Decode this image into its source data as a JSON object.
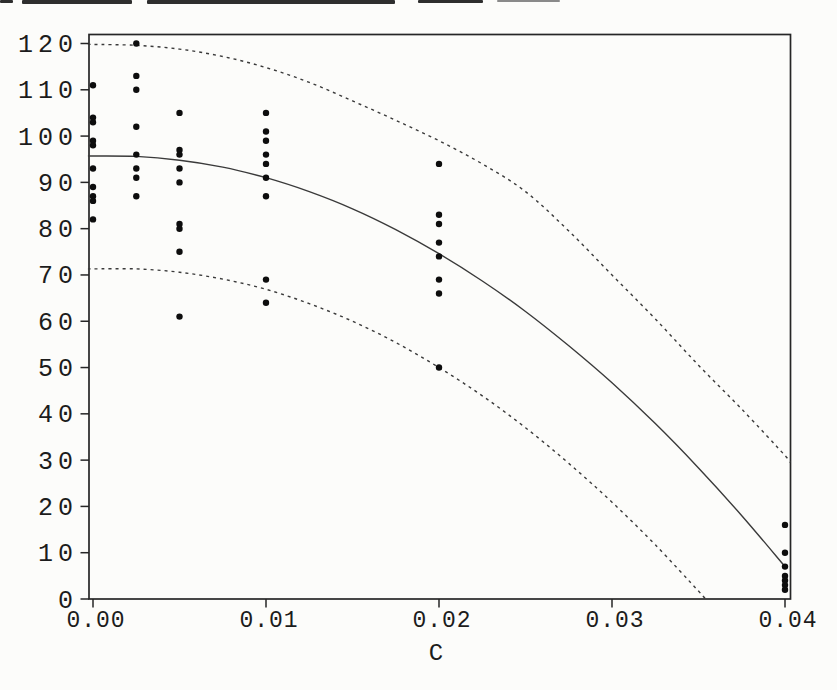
{
  "page": {
    "background": "#fcfcfa"
  },
  "chart_data": {
    "type": "scatter",
    "title": "",
    "xlabel": "C",
    "ylabel": "",
    "xlim": [
      0,
      0.04
    ],
    "ylim": [
      0,
      120
    ],
    "grid": false,
    "legend": "none",
    "x_tick_values": [
      0.0,
      0.01,
      0.02,
      0.03,
      0.04
    ],
    "x_tick_labels": [
      "0.00",
      "0.01",
      "0.02",
      "0.03",
      "0.04"
    ],
    "y_tick_values": [
      0,
      10,
      20,
      30,
      40,
      50,
      60,
      70,
      80,
      90,
      100,
      110,
      120
    ],
    "y_tick_labels": [
      "0",
      "10",
      "20",
      "30",
      "40",
      "50",
      "60",
      "70",
      "80",
      "90",
      "100",
      "110",
      "120"
    ],
    "colors": {
      "ink": "#262626",
      "curve": "#3a3a3a",
      "point": "#0d0d0d",
      "label": "#1c1c1c"
    },
    "observations": [
      {
        "x": 0.0,
        "y": [
          111,
          104,
          103,
          99,
          98,
          93,
          89,
          87,
          86,
          82
        ]
      },
      {
        "x": 0.0025,
        "y": [
          120,
          113,
          110,
          102,
          96,
          93,
          91,
          87
        ]
      },
      {
        "x": 0.005,
        "y": [
          105,
          97,
          96,
          93,
          90,
          81,
          80,
          75,
          61
        ]
      },
      {
        "x": 0.01,
        "y": [
          105,
          101,
          99,
          96,
          94,
          91,
          87,
          69,
          64
        ]
      },
      {
        "x": 0.02,
        "y": [
          94,
          83,
          81,
          77,
          74,
          69,
          66,
          50
        ]
      },
      {
        "x": 0.04,
        "y": [
          16,
          10,
          7,
          5,
          4,
          3,
          2
        ]
      }
    ],
    "fit_curve": {
      "name": "fitted-quadratic-solid",
      "style": "solid",
      "points": [
        [
          -0.0002,
          95.7
        ],
        [
          0,
          95.7
        ],
        [
          0.0025,
          95.6
        ],
        [
          0.005,
          94.8
        ],
        [
          0.0075,
          93.3
        ],
        [
          0.01,
          91.0
        ],
        [
          0.0125,
          88.0
        ],
        [
          0.015,
          84.3
        ],
        [
          0.0175,
          79.8
        ],
        [
          0.02,
          74.6
        ],
        [
          0.0225,
          68.7
        ],
        [
          0.025,
          62.1
        ],
        [
          0.0275,
          54.7
        ],
        [
          0.03,
          46.7
        ],
        [
          0.0325,
          37.9
        ],
        [
          0.035,
          28.3
        ],
        [
          0.0375,
          18.0
        ],
        [
          0.04,
          7.0
        ]
      ]
    },
    "upper_band": {
      "name": "upper-prediction-limit-dashed",
      "style": "dashed",
      "points": [
        [
          -0.0002,
          119.8
        ],
        [
          0,
          119.8
        ],
        [
          0.0025,
          119.6
        ],
        [
          0.005,
          118.8
        ],
        [
          0.0075,
          117.2
        ],
        [
          0.01,
          114.8
        ],
        [
          0.0125,
          111.6
        ],
        [
          0.015,
          107.6
        ],
        [
          0.0175,
          103.4
        ],
        [
          0.02,
          99.0
        ],
        [
          0.0225,
          94.0
        ],
        [
          0.025,
          88.0
        ],
        [
          0.0275,
          79.5
        ],
        [
          0.03,
          70.0
        ],
        [
          0.0325,
          60.5
        ],
        [
          0.035,
          50.5
        ],
        [
          0.0375,
          41.0
        ],
        [
          0.04,
          31.0
        ],
        [
          0.0403,
          29.5
        ]
      ]
    },
    "lower_band": {
      "name": "lower-prediction-limit-dashed",
      "style": "dashed",
      "points": [
        [
          -0.0002,
          71.3
        ],
        [
          0,
          71.3
        ],
        [
          0.0025,
          71.3
        ],
        [
          0.005,
          70.6
        ],
        [
          0.0075,
          69.1
        ],
        [
          0.01,
          66.9
        ],
        [
          0.0125,
          63.8
        ],
        [
          0.015,
          60.0
        ],
        [
          0.0175,
          55.4
        ],
        [
          0.02,
          50.0
        ],
        [
          0.0225,
          43.9
        ],
        [
          0.025,
          37.0
        ],
        [
          0.0275,
          29.3
        ],
        [
          0.03,
          20.9
        ],
        [
          0.0325,
          11.7
        ],
        [
          0.035,
          1.7
        ],
        [
          0.0354,
          0.0
        ]
      ]
    }
  }
}
